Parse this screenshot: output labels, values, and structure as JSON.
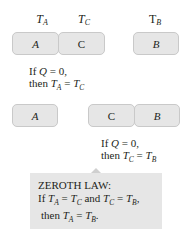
{
  "top": {
    "labels": {
      "ta_main": "T",
      "ta_sub": "A",
      "tc_main": "T",
      "tc_sub": "C",
      "tb_main": "T",
      "tb_sub": "B"
    },
    "boxes": {
      "a": "A",
      "c": "C",
      "b": "B"
    },
    "caption": {
      "line1_pre": "If ",
      "q": "Q",
      "line1_post": " = 0,",
      "line2_pre": "then ",
      "t1": "T",
      "s1": "A",
      "eq": " = ",
      "t2": "T",
      "s2": "C"
    }
  },
  "middle": {
    "boxes": {
      "a": "A",
      "c": "C",
      "b": "B"
    },
    "caption": {
      "line1_pre": "If ",
      "q": "Q",
      "line1_post": " = 0,",
      "line2_pre": "then ",
      "t1": "T",
      "s1": "C",
      "eq": " = ",
      "t2": "T",
      "s2": "B"
    }
  },
  "law": {
    "title": "ZEROTH LAW:",
    "l2_pre": "If ",
    "t1": "T",
    "s1": "A",
    "eq1": " = ",
    "t2": "T",
    "s2": "C",
    "and": " and ",
    "t3": "T",
    "s3": "C",
    "eq2": " = ",
    "t4": "T",
    "s4": "B",
    "comma": ",",
    "l3_pre": "then ",
    "t5": "T",
    "s5": "A",
    "eq3": " = ",
    "t6": "T",
    "s6": "B",
    "period": "."
  }
}
